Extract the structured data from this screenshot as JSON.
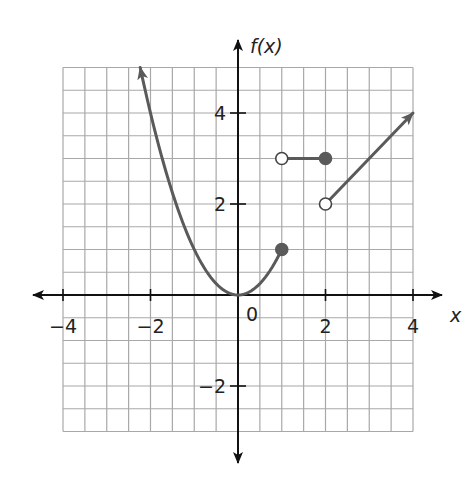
{
  "chart_data": {
    "type": "line",
    "title": "",
    "xlabel": "x",
    "ylabel": "f(x)",
    "xlim": [
      -4,
      4
    ],
    "ylim": [
      -3,
      5
    ],
    "grid": true,
    "grid_step": 0.5,
    "x_ticks": [
      -4,
      -2,
      0,
      2,
      4
    ],
    "x_tick_labels": [
      "−4",
      "−2",
      "0",
      "2",
      "4"
    ],
    "y_ticks": [
      -2,
      2,
      4
    ],
    "y_tick_labels": [
      "−2",
      "2",
      "4"
    ],
    "pieces": [
      {
        "name": "parabola",
        "formula": "f(x) = x^2",
        "domain": "x ≤ 1",
        "from_x": -2.236,
        "to_x": 1,
        "left_end": "arrow",
        "right_end": "closed"
      },
      {
        "name": "constant",
        "formula": "f(x) = 3",
        "domain": "1 < x ≤ 2",
        "from_x": 1,
        "to_x": 2,
        "left_end": "open",
        "right_end": "closed"
      },
      {
        "name": "linear",
        "formula": "f(x) = x",
        "domain": "x > 2",
        "from_x": 2,
        "to_x": 4,
        "left_end": "open",
        "right_end": "arrow"
      }
    ],
    "points": [
      {
        "x": 1,
        "y": 1,
        "style": "closed"
      },
      {
        "x": 1,
        "y": 3,
        "style": "open"
      },
      {
        "x": 2,
        "y": 3,
        "style": "closed"
      },
      {
        "x": 2,
        "y": 2,
        "style": "open"
      }
    ],
    "colors": {
      "curve": "#5a5a5a",
      "axes": "#111111",
      "grid": "#a8a8a8"
    }
  }
}
